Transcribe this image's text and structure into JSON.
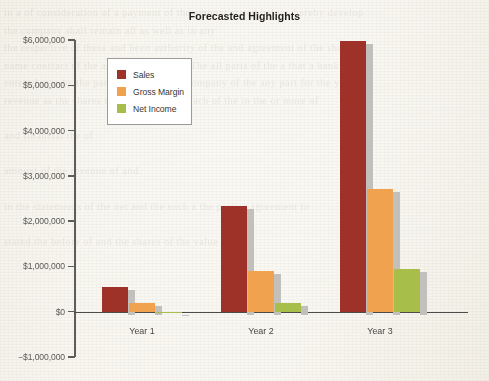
{
  "chart_data": {
    "type": "bar",
    "title": "Forecasted Highlights",
    "xlabel": "",
    "ylabel": "",
    "categories": [
      "Year 1",
      "Year 2",
      "Year 3"
    ],
    "series": [
      {
        "name": "Sales",
        "color": "#9e3229",
        "values": [
          550000,
          2330000,
          5980000
        ]
      },
      {
        "name": "Gross Margin",
        "color": "#f0a24e",
        "values": [
          190000,
          910000,
          2720000
        ]
      },
      {
        "name": "Net Income",
        "color": "#a8be4a",
        "values": [
          -30000,
          190000,
          950000
        ]
      }
    ],
    "ylim": [
      -1000000,
      6000000
    ],
    "ytick_values": [
      6000000,
      5000000,
      4000000,
      3000000,
      2000000,
      1000000,
      0,
      -1000000
    ],
    "ytick_labels": [
      "$6,000,000",
      "$5,000,000",
      "$4,000,000",
      "$3,000,000",
      "$2,000,000",
      "$1,000,000",
      "$0",
      "−$1,000,000"
    ],
    "grid": false,
    "legend_position": "upper-left",
    "bar_shadow_color": "#c2c0bd",
    "axis_color": "#5f5d5b"
  },
  "page_background": {
    "ghost_lines": [
      "in a of consideration of a payment of the amount stated below, hereby  develop",
      "the company shall remain all as well as in any",
      "the respective of these and been authority of the and agreement of the shall",
      "name contract of the against the parties. The all parts of the a that a  bank here",
      "entered into by the parties of a said the company of  the any part for the year",
      "revenue as the shares the fiscal to be  of each of the in the or more of",
      "",
      "and financial the of",
      "",
      "amount of the revenue of  and",
      "",
      "in the statements of the net and the such a the parties  agreement to",
      "",
      "stated the before of and the shares of the value of  cost",
      "",
      "",
      "",
      "",
      "",
      "",
      "",
      "",
      "",
      "",
      "",
      "",
      "",
      "",
      "",
      "",
      "",
      "",
      "",
      "",
      "",
      "",
      "",
      "",
      "",
      "",
      "",
      "",
      "",
      "and the of and the shares of",
      "",
      "and the as of the value  of the and",
      "shares the of the of and",
      "of the and of the part",
      "",
      "and the value of",
      "",
      "of the shares of a",
      "",
      "",
      "",
      "",
      "",
      "and a the amount of the year  and  the revenue of",
      "",
      "the a  of and of the",
      "",
      "the of the in the of the and  the",
      "a of the shares of and"
    ]
  }
}
